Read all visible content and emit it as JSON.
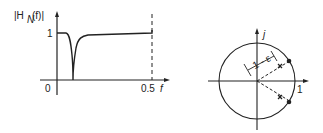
{
  "left_plot": {
    "y_label_prefix": "|H",
    "y_label_sub": "N",
    "y_label_suffix": "(f)|",
    "y_tick_1": "1",
    "x_tick_0": "0",
    "x_tick_end": "0.5",
    "x_label": "f",
    "description": "Notch filter magnitude response: flat at 1, sharp notch to 0 near low frequency, recovering to ~1 up to f = 0.5"
  },
  "right_plot": {
    "imag_axis_label": "j",
    "real_axis_label": "1",
    "radius_annotation": "1 - ε",
    "description": "Unit circle with conjugate zeros (dots) on the circle and poles (x) at radius 1-ε"
  },
  "colors": {
    "ink": "#222222",
    "background": "#ffffff"
  }
}
